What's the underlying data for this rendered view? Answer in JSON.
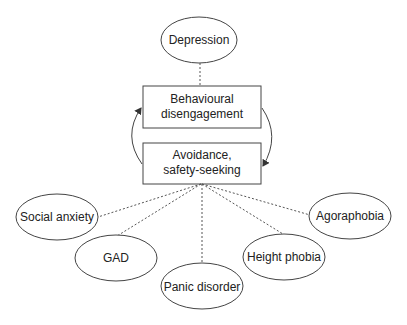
{
  "diagram": {
    "type": "concept-map",
    "colors": {
      "stroke": "#444444",
      "text": "#222222",
      "background": "#ffffff"
    },
    "top_node": {
      "label": "Depression",
      "shape": "ellipse"
    },
    "process_boxes": [
      {
        "label": "Behavioural\ndisengagement",
        "shape": "rectangle"
      },
      {
        "label": "Avoidance,\nsafety-seeking",
        "shape": "rectangle"
      }
    ],
    "cycle_arrows": [
      {
        "from": "Avoidance, safety-seeking",
        "to": "Behavioural disengagement",
        "side": "left"
      },
      {
        "from": "Behavioural disengagement",
        "to": "Avoidance, safety-seeking",
        "side": "right"
      }
    ],
    "disorder_nodes": [
      {
        "label": "Social anxiety",
        "shape": "ellipse"
      },
      {
        "label": "GAD",
        "shape": "ellipse"
      },
      {
        "label": "Panic disorder",
        "shape": "ellipse"
      },
      {
        "label": "Height phobia",
        "shape": "ellipse"
      },
      {
        "label": "Agoraphobia",
        "shape": "ellipse"
      }
    ],
    "connectors": {
      "style": "dotted",
      "top": "Depression — Behavioural disengagement",
      "bottom": "Avoidance, safety-seeking — each disorder"
    }
  }
}
